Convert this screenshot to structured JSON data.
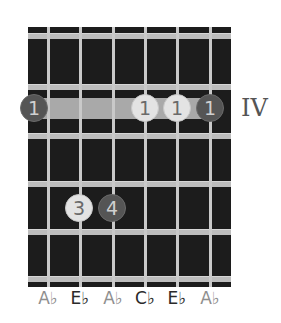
{
  "diagram": {
    "position_label": "IV",
    "strings_x": [
      48,
      80,
      113,
      145,
      177,
      210
    ],
    "frets_y": [
      33,
      84,
      133,
      181,
      229,
      276
    ],
    "barre": {
      "fret_row": 1,
      "from_string": 1,
      "to_string": 6,
      "finger": "1"
    },
    "dots": [
      {
        "string": 1,
        "row": 1,
        "finger": "1",
        "type": "root",
        "x": 34,
        "y": 108
      },
      {
        "string": 4,
        "row": 1,
        "finger": "1",
        "type": "other",
        "x": 145,
        "y": 108
      },
      {
        "string": 5,
        "row": 1,
        "finger": "1",
        "type": "other",
        "x": 177,
        "y": 108
      },
      {
        "string": 6,
        "row": 1,
        "finger": "1",
        "type": "root",
        "x": 210,
        "y": 108
      },
      {
        "string": 2,
        "row": 3,
        "finger": "3",
        "type": "other",
        "x": 79,
        "y": 208
      },
      {
        "string": 3,
        "row": 3,
        "finger": "4",
        "type": "root",
        "x": 112,
        "y": 208
      }
    ],
    "note_labels": [
      {
        "text": "A♭",
        "type": "root"
      },
      {
        "text": "E♭",
        "type": "dark"
      },
      {
        "text": "A♭",
        "type": "root"
      },
      {
        "text": "C♭",
        "type": "dark"
      },
      {
        "text": "E♭",
        "type": "dark"
      },
      {
        "text": "A♭",
        "type": "root"
      }
    ],
    "colors": {
      "board": "#1c1c1c",
      "fret": "#bdbdbd",
      "string": "#c9c9c9",
      "barre": "#a9a9a9",
      "root_dot": "#555555",
      "other_dot": "#e3e3e3"
    }
  }
}
